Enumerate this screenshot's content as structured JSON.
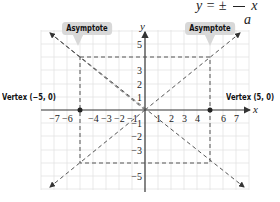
{
  "equation": {
    "lhs": "y = ±",
    "denominator": "a",
    "var": "x"
  },
  "callouts": {
    "left": "Asymptote",
    "right": "Asymptote"
  },
  "vertices": {
    "left": "Vertex (−5, 0)",
    "right": "Vertex (5, 0)"
  },
  "axes": {
    "x_label": "x",
    "y_label": "y"
  },
  "x_ticks": [
    "−7",
    "−6",
    "−4",
    "−3",
    "−2",
    "−1",
    "1",
    "2",
    "3",
    "4",
    "6",
    "7"
  ],
  "y_ticks": [
    "5",
    "3",
    "2",
    "1",
    "−1",
    "−2",
    "−3",
    "−5"
  ],
  "colors": {
    "grid": "#e3e3e3",
    "axis": "#333333",
    "dashed": "#555555",
    "callout_bg": "#d8d8d8"
  }
}
